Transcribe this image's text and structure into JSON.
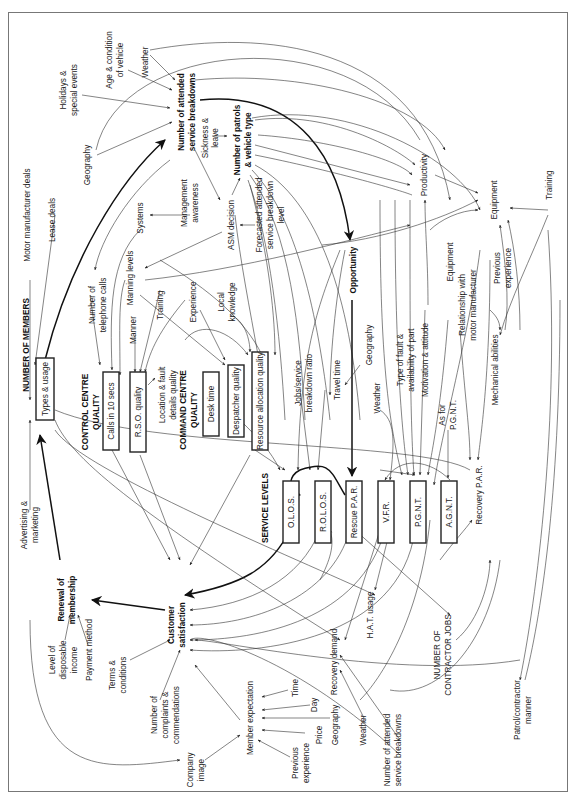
{
  "header": {
    "clipped_text": "ʼ ʼ"
  },
  "diagram": {
    "orientation": "rotated -90deg",
    "colors": {
      "line": "#333333",
      "text": "#222222",
      "box_border": "#222222",
      "background": "#ffffff"
    },
    "nodes": {
      "weather_top": "Weather",
      "age_condition_1": "Age & condition",
      "age_condition_2": "of vehicle",
      "holidays_1": "Holidays &",
      "holidays_2": "special events",
      "geography_top": "Geography",
      "attended_breakdowns_1": "Number of attended",
      "attended_breakdowns_2": "service breakdowns",
      "sickness_1": "Sickness &",
      "sickness_2": "leave",
      "patrols_1": "Number of patrols",
      "patrols_2": "& vehicle type",
      "forecast_1": "Forecasted attended",
      "forecast_2": "service breakdown",
      "forecast_3": "level",
      "asm_decision": "ASM decision",
      "management_awareness_1": "Management",
      "management_awareness_2": "awareness",
      "systems": "Systems",
      "manning_levels": "Manning levels",
      "telephone_calls_1": "Number of",
      "telephone_calls_2": "telephone calls",
      "training_left": "Training",
      "manner": "Manner",
      "experience": "Experience",
      "local_knowledge_1": "Local",
      "local_knowledge_2": "knowledge",
      "location_fault_1": "Location & fault",
      "location_fault_2": "details quality",
      "motor_manufacturer_deals": "Motor manufacturer deals",
      "lease_deals": "Lease deals",
      "number_of_members": "NUMBER OF MEMBERS",
      "advertising_1": "Advertising &",
      "advertising_2": "marketing",
      "renewal_1": "Renewal of",
      "renewal_2": "membership",
      "disposable_income_1": "Level of",
      "disposable_income_2": "disposable",
      "disposable_income_3": "income",
      "payment_method": "Payment method",
      "terms_1": "Terms &",
      "terms_2": "conditions",
      "complaints_1": "Number of",
      "complaints_2": "complaints &",
      "complaints_3": "commendations",
      "customer_satisfaction_1": "Customer",
      "customer_satisfaction_2": "satisfaction",
      "company_image_1": "Company",
      "company_image_2": "image",
      "member_expectation": "Member expectation",
      "time": "Time",
      "day": "Day",
      "geography_bottom": "Geography",
      "price": "Price",
      "previous_experience_bottom_1": "Previous",
      "previous_experience_bottom_2": "experience",
      "weather_bottom": "Weather",
      "attended_breakdowns_bottom_1": "Number of attended",
      "attended_breakdowns_bottom_2": "service breakdowns",
      "recovery_demand": "Recovery demand",
      "hat_usage": "H.A.T. usage",
      "contractor_jobs_1": "NUMBER OF",
      "contractor_jobs_2": "CONTRACTOR JOBS",
      "patrol_contractor_manner_1": "Patrol/contractor",
      "patrol_contractor_manner_2": "manner",
      "recovery_par": "Recovery P.A.R.",
      "as_for_pgnt_1": "As for",
      "as_for_pgnt_2": "P.G.N.T.",
      "mechanical_abilities": "Mechanical abilities",
      "relationship_1": "Relationship with",
      "relationship_2": "motor manufacturer",
      "previous_experience_right_1": "Previous",
      "previous_experience_right_2": "experience",
      "equipment_right": "Equipment",
      "equipment_mid": "Equipment",
      "training_right": "Training",
      "productivity": "Productivity",
      "opportunity": "Opportunity",
      "motivation": "Motivation & attitude",
      "type_of_fault_1": "Type of fault &",
      "type_of_fault_2": "availability of part",
      "geography_mid": "Geography",
      "weather_mid": "Weather",
      "travel_time": "Travel time",
      "jobs_ratio_1": "Jobs/service",
      "jobs_ratio_2": "breakdown ratio"
    },
    "groups": {
      "control_centre_1": "CONTROL CENTRE",
      "control_centre_2": "QUALITY",
      "command_centre_1": "COMMAND CENTRE",
      "command_centre_2": "QUALITY",
      "service_levels": "SERVICE LEVELS"
    },
    "boxes": {
      "types_usage": "Types & usage",
      "calls_10_secs": "Calls in 10 secs",
      "rso_quality": "R.S.O. quality",
      "desk_time": "Desk time",
      "despatcher_quality": "Despatcher quality",
      "resource_allocation_quality": "Resource allocation quality",
      "olos": "O.L.O.S.",
      "rolos": "R.O.L.O.S.",
      "rescue_par": "Rescue P.A.R.",
      "vfr": "V.F.R.",
      "pgnt": "P.G.N.T.",
      "agnt": "A.G.N.T."
    }
  }
}
